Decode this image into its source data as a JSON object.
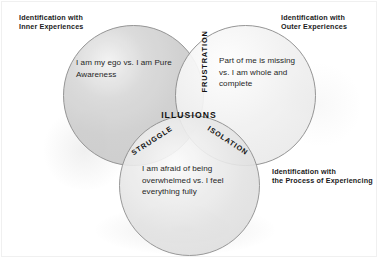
{
  "diagram": {
    "type": "venn-3-circle",
    "center_label": "ILLUSIONS",
    "corner_labels": {
      "inner": {
        "line1": "Identification with",
        "line2": "Inner Experiences"
      },
      "outer": {
        "line1": "Identification with",
        "line2": "Outer Experiences"
      },
      "process": {
        "line1": "Identification with",
        "line2": "the Process of Experiencing"
      }
    },
    "circles": [
      {
        "id": "inner",
        "name": "Identification with Inner Experiences",
        "body_text": "I am my ego vs. I am Pure Awareness",
        "fill": "#cdcdcd",
        "stroke": "#8e8e8e"
      },
      {
        "id": "outer",
        "name": "Identification with Outer Experiences",
        "body_text": "Part of me is missing vs. I am whole and complete",
        "fill": "#ececec",
        "stroke": "#8e8e8e"
      },
      {
        "id": "process",
        "name": "Identification with the Process of Experiencing",
        "body_text": "I am afraid of being overwhelmed vs. I feel everything fully",
        "fill": "#e0e0e0",
        "stroke": "#8e8e8e"
      }
    ],
    "intersections": [
      {
        "id": "frustration",
        "label": "FRUSTRATION",
        "between": [
          "inner",
          "outer"
        ],
        "rotation_deg": -90
      },
      {
        "id": "struggle",
        "label": "STRUGGLE",
        "between": [
          "inner",
          "process"
        ],
        "rotation_deg": -33
      },
      {
        "id": "isolation",
        "label": "ISOLATION",
        "between": [
          "outer",
          "process"
        ],
        "rotation_deg": 33
      },
      {
        "id": "illusions",
        "label": "ILLUSIONS",
        "between": [
          "inner",
          "outer",
          "process"
        ],
        "rotation_deg": 0
      }
    ],
    "background": "#ffffff",
    "text_color": "#262626"
  }
}
